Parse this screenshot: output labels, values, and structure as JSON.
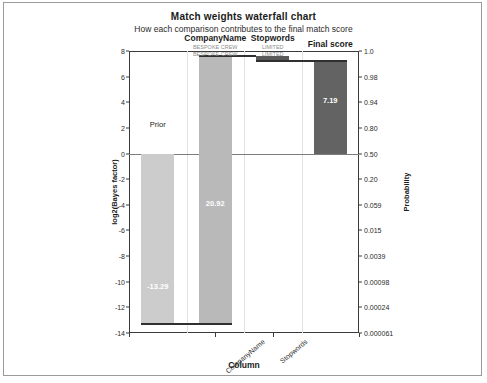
{
  "chart_data": {
    "type": "bar",
    "title": "Match weights waterfall chart",
    "subtitle": "How each comparison contributes to the final match score",
    "xlabel": "Column",
    "ylabel": "log2(Bayes factor)",
    "ylabel_right": "Probability",
    "ylim": [
      -14,
      8
    ],
    "grid": true,
    "legend": "none",
    "categories": [
      "Prior",
      "CompanyName",
      "Stopwords",
      "Final score"
    ],
    "xtick_labels": [
      "CompanyName",
      "Stopwords"
    ],
    "left_ticks": [
      8,
      6,
      4,
      2,
      0,
      -2,
      -4,
      -6,
      -8,
      -10,
      -12,
      -14
    ],
    "left_tick_labels": [
      "8",
      "6",
      "4",
      "2",
      "0",
      "-2",
      "-4",
      "-6",
      "-8",
      "-10",
      "-12",
      "-14"
    ],
    "right_ticks": [
      8,
      6,
      4,
      2,
      0,
      -2,
      -4,
      -6,
      -8,
      -10,
      -12,
      -14
    ],
    "right_tick_labels": [
      "1.0",
      "0.98",
      "0.94",
      "0.80",
      "0.50",
      "0.20",
      "0.059",
      "0.015",
      "0.0039",
      "0.00098",
      "0.00024",
      "0.000061"
    ],
    "bars": [
      {
        "name": "Prior",
        "label": "-13.29",
        "start": 0,
        "end": -13.29,
        "value": -13.29,
        "color": "#cccccc",
        "label_color": "#ffffff"
      },
      {
        "name": "CompanyName",
        "label": "20.92",
        "start": -13.29,
        "end": 7.63,
        "value": 20.92,
        "color": "#b9b9b9",
        "label_color": "#ffffff"
      },
      {
        "name": "Stopwords",
        "label": "",
        "start": 7.63,
        "end": 7.19,
        "value": -0.44,
        "color": "#5a5a5a",
        "label_color": "#ffffff"
      },
      {
        "name": "Final score",
        "label": "7.19",
        "start": 0,
        "end": 7.19,
        "value": 7.19,
        "color": "#636363",
        "label_color": "#ffffff"
      }
    ],
    "annotations": [
      {
        "text": "Prior",
        "x_category": "Prior",
        "y": 2.3,
        "color": "#1a1a1a"
      }
    ],
    "column_headers": [
      {
        "label": "CompanyName",
        "sub": "BESPOKE CREW\nBESPOKE CREW",
        "x_category": "CompanyName"
      },
      {
        "label": "Stopwords",
        "sub": "LIMITED\nLIMITED",
        "x_category": "Stopwords"
      },
      {
        "label": "Final score",
        "sub": "",
        "x_category": "Final score"
      }
    ],
    "colors": {
      "prior": "#cccccc",
      "companyname": "#b9b9b9",
      "stopwords": "#5a5a5a",
      "final_score": "#636363",
      "axis": "#3a3a3a",
      "grid": "#e2e2e2",
      "zero_line": "#7d7d7d",
      "sub_label": "#8e8e8e"
    }
  }
}
